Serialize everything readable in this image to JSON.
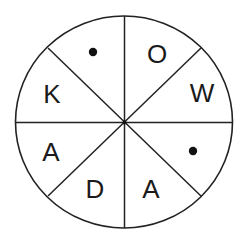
{
  "diagram": {
    "type": "circle-divided-into-8-sectors",
    "colors": {
      "stroke": "#222222",
      "text": "#1a1a1a",
      "background": "#ffffff"
    },
    "sectors": [
      {
        "position": "top-left-upper",
        "content_type": "dot",
        "label": "•"
      },
      {
        "position": "top-right-upper",
        "content_type": "letter",
        "label": "O"
      },
      {
        "position": "right-upper",
        "content_type": "letter",
        "label": "W"
      },
      {
        "position": "right-lower",
        "content_type": "dot",
        "label": "•"
      },
      {
        "position": "bottom-right",
        "content_type": "letter",
        "label": "A"
      },
      {
        "position": "bottom-left",
        "content_type": "letter",
        "label": "D"
      },
      {
        "position": "left-lower",
        "content_type": "letter",
        "label": "A"
      },
      {
        "position": "left-upper",
        "content_type": "letter",
        "label": "K"
      }
    ]
  }
}
